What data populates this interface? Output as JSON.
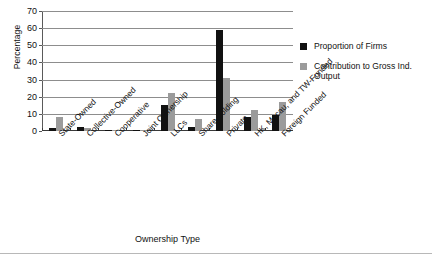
{
  "chart_data": {
    "type": "bar",
    "title": "",
    "xlabel": "Ownership Type",
    "ylabel": "Percentage",
    "ylim": [
      0,
      70
    ],
    "yticks": [
      0,
      10,
      20,
      30,
      40,
      50,
      60,
      70
    ],
    "grid": true,
    "legend_position": "right",
    "categories": [
      "State-Owned",
      "Collective-Owned",
      "Cooperative",
      "Joint Ownership",
      "LLCs",
      "Share-holding",
      "Private",
      "HK, Macau, and TW-Funded",
      "Foreign Funded"
    ],
    "category_lines": [
      [
        "State-Owned"
      ],
      [
        "Collective-Owned"
      ],
      [
        "Cooperative"
      ],
      [
        "Joint Ownership"
      ],
      [
        "LLCs"
      ],
      [
        "Share-holding"
      ],
      [
        "Private"
      ],
      [
        "HK, Macau, and TW-Funded"
      ],
      [
        "Foreign Funded"
      ]
    ],
    "series": [
      {
        "name": "Proportion of Firms",
        "color": "#111111",
        "values": [
          2,
          2.3,
          0.8,
          0.4,
          15.3,
          2.2,
          58.8,
          8,
          9.2
        ]
      },
      {
        "name": "Contribution to Gross Ind. Output",
        "color": "#9b9b9b",
        "values": [
          8,
          1.6,
          0.5,
          0.4,
          22,
          7,
          31,
          12,
          17
        ]
      }
    ]
  },
  "legend": {
    "items": [
      {
        "label": "Proportion of Firms"
      },
      {
        "label": "Contribution to Gross Ind. Output"
      }
    ]
  },
  "footer": {
    "caption": ""
  }
}
